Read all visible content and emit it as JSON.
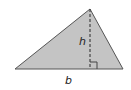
{
  "diagram": {
    "type": "triangle-area",
    "labels": {
      "height": "h",
      "base": "b"
    },
    "colors": {
      "fill": "#c4c4c4",
      "stroke": "#555555",
      "altitude": "#444444"
    },
    "points": {
      "apex": [
        90,
        9
      ],
      "base_left": [
        15,
        69
      ],
      "base_right": [
        123,
        69
      ]
    }
  }
}
